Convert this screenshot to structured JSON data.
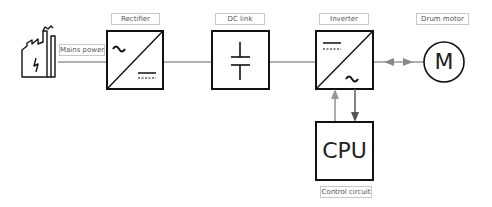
{
  "diagram": {
    "title": "",
    "nodes": [
      {
        "id": "mains",
        "label": "Mains power",
        "icon": "factory-icon"
      },
      {
        "id": "rectifier",
        "label": "Rectifier",
        "symbol_top": "~",
        "symbol_bottom": "DC"
      },
      {
        "id": "dclink",
        "label": "DC link",
        "symbol": "capacitor"
      },
      {
        "id": "inverter",
        "label": "Inverter",
        "symbol_top": "DC",
        "symbol_bottom": "~"
      },
      {
        "id": "motor",
        "label": "Drum motor",
        "symbol": "M"
      },
      {
        "id": "cpu",
        "label": "Control circuit",
        "symbol": "CPU"
      }
    ],
    "edges": [
      {
        "from": "mains",
        "to": "rectifier"
      },
      {
        "from": "rectifier",
        "to": "dclink"
      },
      {
        "from": "dclink",
        "to": "inverter"
      },
      {
        "from": "inverter",
        "to": "motor",
        "bidirectional": true
      },
      {
        "from": "cpu",
        "to": "inverter",
        "arrow": "up"
      },
      {
        "from": "inverter",
        "to": "cpu",
        "arrow": "down"
      }
    ]
  },
  "labels": {
    "mains": "Mains power",
    "rectifier": "Rectifier",
    "dclink": "DC link",
    "inverter": "Inverter",
    "motor": "Drum motor",
    "cpu_caption": "Control circuit",
    "cpu_symbol": "CPU",
    "motor_symbol": "M"
  },
  "colors": {
    "line": "#999999",
    "box": "#111111",
    "arrow_up": "#999999",
    "arrow_down": "#555555"
  }
}
